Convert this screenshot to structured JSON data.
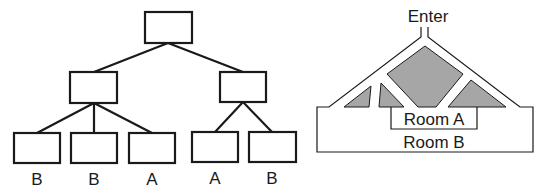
{
  "tree": {
    "nodes": {
      "root": {
        "x": 145,
        "y": 12,
        "w": 47,
        "h": 31
      },
      "mid_left": {
        "x": 70,
        "y": 72,
        "w": 47,
        "h": 31
      },
      "mid_right": {
        "x": 220,
        "y": 72,
        "w": 46,
        "h": 30
      }
    },
    "leaves": [
      {
        "x": 14,
        "y": 133,
        "w": 46,
        "h": 30,
        "label": "B"
      },
      {
        "x": 71,
        "y": 133,
        "w": 46,
        "h": 30,
        "label": "B"
      },
      {
        "x": 129,
        "y": 133,
        "w": 46,
        "h": 30,
        "label": "A"
      },
      {
        "x": 192,
        "y": 132,
        "w": 46,
        "h": 30,
        "label": "A"
      },
      {
        "x": 249,
        "y": 132,
        "w": 47,
        "h": 30,
        "label": "B"
      }
    ]
  },
  "maze": {
    "enter_label": "Enter",
    "room_a_label": "Room A",
    "room_b_label": "Room B",
    "block_color": "#a6a6a6"
  }
}
